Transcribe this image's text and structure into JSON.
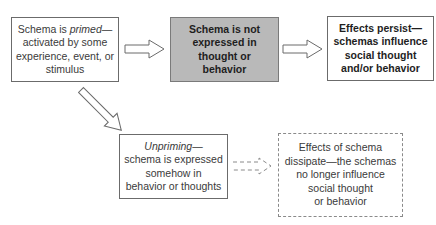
{
  "diagram": {
    "nodes": [
      {
        "id": "primed",
        "style": "solid",
        "lines": [
          "Schema is primed—",
          "activated by some",
          "experience, event, or",
          "stimulus"
        ],
        "italic_word": "primed"
      },
      {
        "id": "not-expressed",
        "style": "shaded-bold",
        "fill": "#b9b9b9",
        "lines": [
          "Schema is not",
          "expressed in",
          "thought or",
          "behavior"
        ]
      },
      {
        "id": "effects-persist",
        "style": "solid-bold",
        "lines": [
          "Effects persist—",
          "schemas influence",
          "social thought",
          "and/or behavior"
        ]
      },
      {
        "id": "unpriming",
        "style": "solid",
        "lines": [
          "Unpriming—",
          "schema is expressed",
          "somehow in",
          "behavior or thoughts"
        ],
        "italic_word": "Unpriming"
      },
      {
        "id": "effects-dissipate",
        "style": "dashed",
        "lines": [
          "Effects of schema",
          "dissipate—the schemas",
          "no longer influence",
          "social thought",
          "or behavior"
        ]
      }
    ],
    "edges": [
      {
        "from": "primed",
        "to": "not-expressed",
        "style": "hollow-arrow"
      },
      {
        "from": "not-expressed",
        "to": "effects-persist",
        "style": "hollow-arrow"
      },
      {
        "from": "primed",
        "to": "unpriming",
        "style": "hollow-arrow-diagonal"
      },
      {
        "from": "unpriming",
        "to": "effects-dissipate",
        "style": "dashed-hollow-arrow"
      }
    ]
  },
  "text": {
    "n1_pre": "Schema is ",
    "n1_em": "primed",
    "n1_post": "—",
    "n1_l2": "activated by some",
    "n1_l3": "experience, event, or",
    "n1_l4": "stimulus",
    "n2_l1": "Schema is not",
    "n2_l2": "expressed in",
    "n2_l3": "thought or",
    "n2_l4": "behavior",
    "n3_l1": "Effects persist—",
    "n3_l2": "schemas influence",
    "n3_l3": "social thought",
    "n3_l4": "and/or behavior",
    "n4_em": "Unpriming",
    "n4_post": "—",
    "n4_l2": "schema is expressed",
    "n4_l3": "somehow in",
    "n4_l4": "behavior or thoughts",
    "n5_l1": "Effects of schema",
    "n5_l2": "dissipate—the schemas",
    "n5_l3": "no longer influence",
    "n5_l4": "social thought",
    "n5_l5": "or behavior"
  }
}
